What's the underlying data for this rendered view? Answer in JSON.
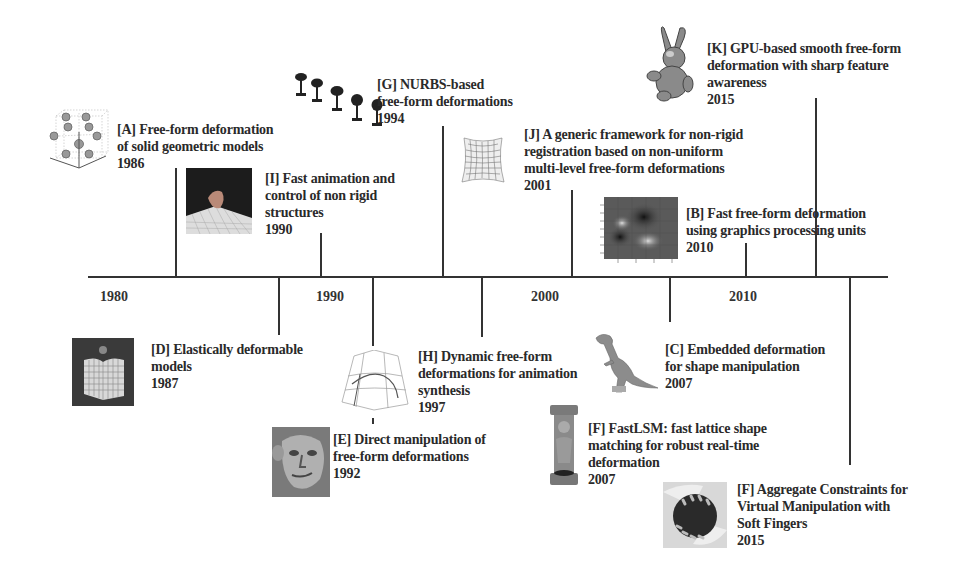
{
  "timeline": {
    "axis_labels": [
      "1980",
      "1990",
      "2000",
      "2010"
    ],
    "entries": [
      {
        "id": "A",
        "lines": [
          "[A] Free-form deformation",
          "of solid geometric models"
        ],
        "year": "1986",
        "image": "lattice-spheres-icon"
      },
      {
        "id": "I",
        "lines": [
          "[I] Fast animation and",
          "control of non rigid",
          "structures"
        ],
        "year": "1990",
        "image": "deformed-cube-on-grid-icon"
      },
      {
        "id": "G",
        "lines": [
          "[G] NURBS-based",
          "free-form deformations"
        ],
        "year": "1994",
        "image": "goblets-icon"
      },
      {
        "id": "J",
        "lines": [
          "[J] A generic framework for non-rigid",
          "registration based on non-uniform",
          "multi-level free-form deformations"
        ],
        "year": "2001",
        "image": "warped-grid-icon"
      },
      {
        "id": "K",
        "lines": [
          "[K] GPU-based smooth free-form",
          "deformation with sharp feature",
          "awareness"
        ],
        "year": "2015",
        "image": "bunny-icon"
      },
      {
        "id": "B",
        "lines": [
          "[B] Fast free-form deformation",
          "using graphics processing units"
        ],
        "year": "2010",
        "image": "heatmap-icon"
      },
      {
        "id": "D",
        "lines": [
          "[D] Elastically deformable",
          "models"
        ],
        "year": "1987",
        "image": "elastic-cube-icon"
      },
      {
        "id": "H",
        "lines": [
          "[H] Dynamic free-form",
          "deformations for animation",
          "synthesis"
        ],
        "year": "1997",
        "image": "wireframe-lattice-icon"
      },
      {
        "id": "E",
        "lines": [
          "[E] Direct manipulation of",
          "free-form deformations"
        ],
        "year": "1992",
        "image": "face-sculpture-icon"
      },
      {
        "id": "C",
        "lines": [
          "[C] Embedded deformation",
          "for shape manipulation"
        ],
        "year": "2007",
        "image": "dinosaur-icon"
      },
      {
        "id": "F1",
        "lines": [
          "[F] FastLSM: fast lattice shape",
          "matching for robust real-time",
          "deformation"
        ],
        "year": "2007",
        "image": "statue-icon"
      },
      {
        "id": "F2",
        "lines": [
          "[F] Aggregate Constraints for",
          "Virtual Manipulation with",
          "Soft Fingers"
        ],
        "year": "2015",
        "image": "soft-fingers-grasp-icon"
      }
    ]
  }
}
